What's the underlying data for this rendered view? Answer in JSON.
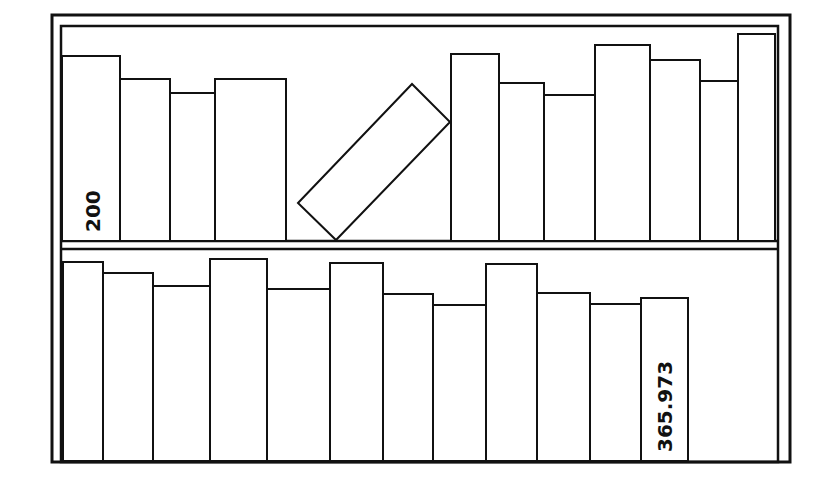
{
  "colors": {
    "stroke": "#111111",
    "fill": "#ffffff"
  },
  "bookcase": {
    "outer": {
      "x": 52,
      "y": 15,
      "w": 738,
      "h": 447
    },
    "inner": {
      "x": 61,
      "y": 26,
      "w": 717,
      "h": 436
    },
    "shelf_divider": {
      "y1": 241,
      "y2": 249
    }
  },
  "top_shelf": {
    "baseline": 241,
    "books": [
      {
        "x": 62,
        "w": 58,
        "top": 56,
        "label": "200"
      },
      {
        "x": 120,
        "w": 50,
        "top": 79
      },
      {
        "x": 170,
        "w": 45,
        "top": 93
      },
      {
        "x": 215,
        "w": 71,
        "top": 79
      },
      {
        "x": 451,
        "w": 48,
        "top": 54
      },
      {
        "x": 499,
        "w": 45,
        "top": 83
      },
      {
        "x": 544,
        "w": 51,
        "top": 95
      },
      {
        "x": 595,
        "w": 55,
        "top": 45
      },
      {
        "x": 650,
        "w": 50,
        "top": 60
      },
      {
        "x": 700,
        "w": 38,
        "top": 81
      },
      {
        "x": 738,
        "w": 37,
        "top": 34
      }
    ],
    "tilted_book": {
      "points": "298,203 412,84 450,122 336,240"
    }
  },
  "bottom_shelf": {
    "baseline": 461,
    "books": [
      {
        "x": 63,
        "w": 40,
        "top": 262
      },
      {
        "x": 103,
        "w": 50,
        "top": 273
      },
      {
        "x": 153,
        "w": 57,
        "top": 286
      },
      {
        "x": 210,
        "w": 57,
        "top": 259
      },
      {
        "x": 267,
        "w": 63,
        "top": 289
      },
      {
        "x": 330,
        "w": 53,
        "top": 263
      },
      {
        "x": 383,
        "w": 50,
        "top": 294
      },
      {
        "x": 433,
        "w": 53,
        "top": 305
      },
      {
        "x": 486,
        "w": 51,
        "top": 264
      },
      {
        "x": 537,
        "w": 53,
        "top": 293
      },
      {
        "x": 590,
        "w": 51,
        "top": 304
      },
      {
        "x": 641,
        "w": 47,
        "top": 298,
        "label": "365.973"
      }
    ]
  },
  "labels": {
    "top_spine": "200",
    "bottom_spine": "365.973"
  }
}
